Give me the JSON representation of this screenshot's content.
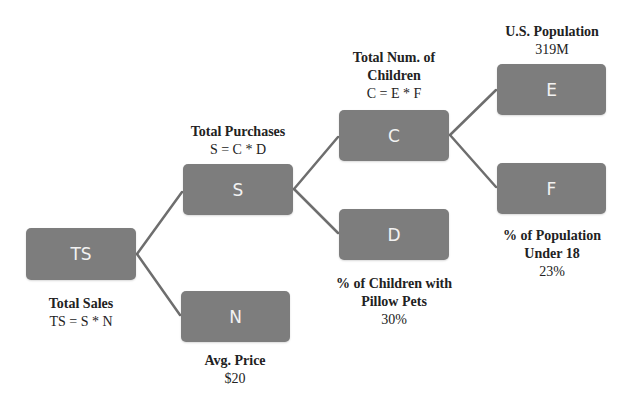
{
  "diagram": {
    "type": "driver-tree",
    "colors": {
      "node_fill": "#7d7d7d",
      "node_text": "#f2f2f2",
      "link": "#6e6e6e"
    },
    "nodes": {
      "ts": {
        "id": "TS",
        "title": "Total Sales",
        "value": "TS = S * N"
      },
      "s": {
        "id": "S",
        "title": "Total Purchases",
        "value": "S = C * D"
      },
      "n": {
        "id": "N",
        "title": "Avg. Price",
        "value": "$20"
      },
      "c": {
        "id": "C",
        "title_line1": "Total Num. of",
        "title_line2": "Children",
        "value": "C = E * F"
      },
      "d": {
        "id": "D",
        "title_line1": "% of Children with",
        "title_line2": "Pillow Pets",
        "value": "30%"
      },
      "e": {
        "id": "E",
        "title": "U.S. Population",
        "value": "319M"
      },
      "f": {
        "id": "F",
        "title_line1": "% of Population",
        "title_line2": "Under 18",
        "value": "23%"
      }
    },
    "edges": [
      [
        "TS",
        "S"
      ],
      [
        "TS",
        "N"
      ],
      [
        "S",
        "C"
      ],
      [
        "S",
        "D"
      ],
      [
        "C",
        "E"
      ],
      [
        "C",
        "F"
      ]
    ]
  }
}
